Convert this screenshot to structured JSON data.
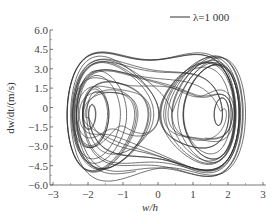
{
  "chart_data": {
    "type": "line",
    "subtype": "phase-portrait",
    "title": "",
    "xlabel": "w/h",
    "ylabel": "dw/dt/(m/s)",
    "xlim": [
      -3,
      3
    ],
    "ylim": [
      -6.0,
      6.0
    ],
    "xticks": [
      -3,
      -2,
      -1,
      0,
      1,
      2,
      3
    ],
    "xtick_labels": [
      "-3",
      "-2",
      "-1",
      "0",
      "1",
      "2",
      "3"
    ],
    "yticks": [
      6.0,
      4.5,
      3.0,
      1.5,
      0,
      -1.5,
      -3.0,
      -4.5,
      -6.0
    ],
    "ytick_labels": [
      "6.0",
      "4.5",
      "3.0",
      "1.5",
      "0",
      "-1.5",
      "-3.0",
      "-4.5",
      "-6.0"
    ],
    "grid": false,
    "legend_position": "upper right",
    "series": [
      {
        "name": "λ=1 000",
        "color": "#333333",
        "description": "Chaotic phase trajectory; many overlapping loops spanning w/h ≈ -2.6 to 2.5 and dw/dt ≈ -5.7 to 4.3",
        "approx_bounds": {
          "x_min": -2.6,
          "x_max": 2.5,
          "y_min": -5.7,
          "y_max": 4.3
        }
      }
    ]
  },
  "legend": {
    "label": "λ=1 000"
  },
  "axes": {
    "xlabel": "w/h",
    "ylabel": "dw/dt/(m/s)"
  }
}
